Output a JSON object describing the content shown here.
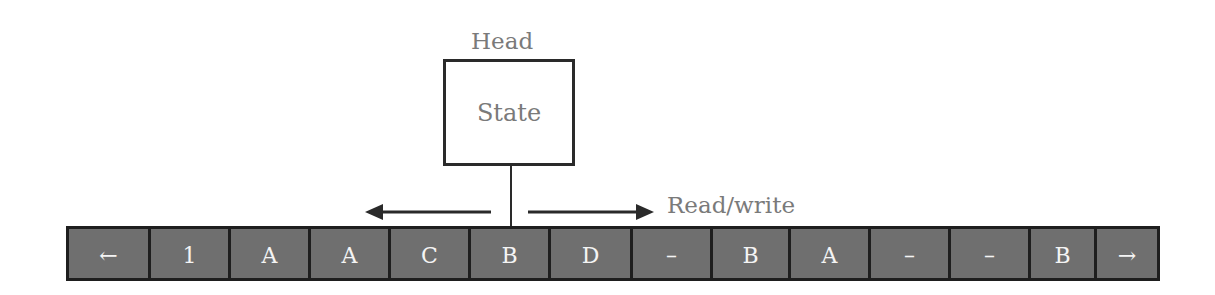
{
  "diagram": {
    "head": {
      "label": "Head",
      "state_label": "State"
    },
    "movement": {
      "label": "Read/write",
      "left_arrow": "arrow-left",
      "right_arrow": "arrow-right"
    },
    "tape": {
      "cells": [
        {
          "symbol": "←",
          "width": 82
        },
        {
          "symbol": "1",
          "width": 80
        },
        {
          "symbol": "A",
          "width": 80
        },
        {
          "symbol": "A",
          "width": 80
        },
        {
          "symbol": "C",
          "width": 80
        },
        {
          "symbol": "B",
          "width": 80
        },
        {
          "symbol": "D",
          "width": 82
        },
        {
          "symbol": "–",
          "width": 80
        },
        {
          "symbol": "B",
          "width": 78
        },
        {
          "symbol": "A",
          "width": 80
        },
        {
          "symbol": "–",
          "width": 80
        },
        {
          "symbol": "–",
          "width": 80
        },
        {
          "symbol": "B",
          "width": 66
        },
        {
          "symbol": "→",
          "width": 60
        }
      ],
      "head_position_index": 5
    },
    "colors": {
      "tape_cell": "#6f6f6f",
      "tape_border": "#1e1e1e",
      "cell_text": "#f4f4f4",
      "label_text": "#7a7a7a",
      "lines": "#2a2a2a"
    }
  }
}
